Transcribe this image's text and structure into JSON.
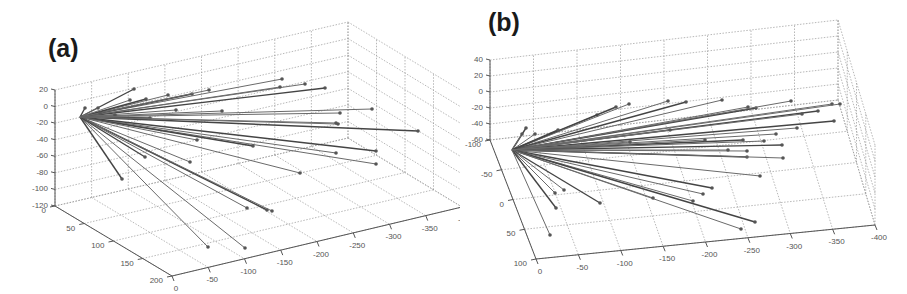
{
  "chart_data": [
    {
      "panel": "(a)",
      "type": "line3d",
      "title": "",
      "description": "3D ray plot: many line segments radiating from a common origin point to scattered endpoints",
      "axes": {
        "z": {
          "ticks": [
            "20",
            "0",
            "-20",
            "-40",
            "-60",
            "-80",
            "-100",
            "-120"
          ],
          "range": [
            -120,
            20
          ]
        },
        "y": {
          "ticks": [
            "0",
            "50",
            "100",
            "150",
            "200"
          ],
          "range": [
            0,
            200
          ]
        },
        "x": {
          "ticks": [
            "0",
            "-50",
            "-100",
            "-150",
            "-200",
            "-250",
            "-300",
            "-350",
            "-400"
          ],
          "range": [
            0,
            -400
          ]
        }
      },
      "grid": true,
      "origin_px": [
        80,
        117
      ],
      "endpoints_px": [
        [
          134,
          89
        ],
        [
          282,
          79
        ],
        [
          305,
          84
        ],
        [
          325,
          88
        ],
        [
          280,
          87
        ],
        [
          372,
          109
        ],
        [
          418,
          131
        ],
        [
          338,
          124
        ],
        [
          336,
          153
        ],
        [
          376,
          151
        ],
        [
          376,
          164
        ],
        [
          300,
          173
        ],
        [
          253,
          146
        ],
        [
          197,
          140
        ],
        [
          190,
          162
        ],
        [
          122,
          179
        ],
        [
          208,
          247
        ],
        [
          245,
          248
        ],
        [
          267,
          210
        ],
        [
          247,
          208
        ],
        [
          272,
          211
        ],
        [
          145,
          157
        ],
        [
          222,
          111
        ],
        [
          176,
          110
        ],
        [
          192,
          94
        ],
        [
          209,
          90
        ],
        [
          168,
          95
        ],
        [
          146,
          99
        ],
        [
          130,
          100
        ],
        [
          98,
          108
        ],
        [
          85,
          108
        ],
        [
          100,
          113
        ],
        [
          115,
          115
        ],
        [
          150,
          118
        ],
        [
          340,
          113
        ],
        [
          336,
          123
        ]
      ]
    },
    {
      "panel": "(b)",
      "type": "line3d",
      "title": "",
      "description": "3D ray plot: many line segments radiating from a common origin point to scattered endpoints",
      "axes": {
        "z": {
          "ticks": [
            "40",
            "20",
            "0",
            "-20",
            "-40",
            "-60"
          ],
          "range": [
            -60,
            40
          ]
        },
        "y": {
          "ticks": [
            "-100",
            "-50",
            "0",
            "50",
            "100"
          ],
          "range": [
            -100,
            100
          ]
        },
        "x": {
          "ticks": [
            "0",
            "-50",
            "-100",
            "-150",
            "-200",
            "-250",
            "-300",
            "-350",
            "-400"
          ],
          "range": [
            0,
            -400
          ]
        }
      },
      "grid": true,
      "origin_px": [
        52,
        150
      ],
      "endpoints_px": [
        [
          66,
          128
        ],
        [
          75,
          134
        ],
        [
          137,
          115
        ],
        [
          156,
          107
        ],
        [
          169,
          104
        ],
        [
          208,
          101
        ],
        [
          226,
          102
        ],
        [
          262,
          100
        ],
        [
          288,
          107
        ],
        [
          296,
          108
        ],
        [
          331,
          101
        ],
        [
          372,
          104
        ],
        [
          358,
          111
        ],
        [
          342,
          114
        ],
        [
          380,
          104
        ],
        [
          374,
          121
        ],
        [
          337,
          128
        ],
        [
          316,
          134
        ],
        [
          283,
          140
        ],
        [
          245,
          140
        ],
        [
          304,
          141
        ],
        [
          322,
          145
        ],
        [
          287,
          151
        ],
        [
          268,
          150
        ],
        [
          287,
          157
        ],
        [
          323,
          158
        ],
        [
          300,
          176
        ],
        [
          252,
          188
        ],
        [
          243,
          194
        ],
        [
          233,
          201
        ],
        [
          295,
          222
        ],
        [
          281,
          229
        ],
        [
          193,
          198
        ],
        [
          140,
          203
        ],
        [
          104,
          190
        ],
        [
          95,
          193
        ],
        [
          96,
          208
        ],
        [
          90,
          235
        ],
        [
          62,
          134
        ],
        [
          98,
          130
        ],
        [
          170,
          142
        ],
        [
          210,
          130
        ]
      ]
    }
  ],
  "panels": {
    "a": {
      "label": "(a)"
    },
    "b": {
      "label": "(b)"
    }
  }
}
